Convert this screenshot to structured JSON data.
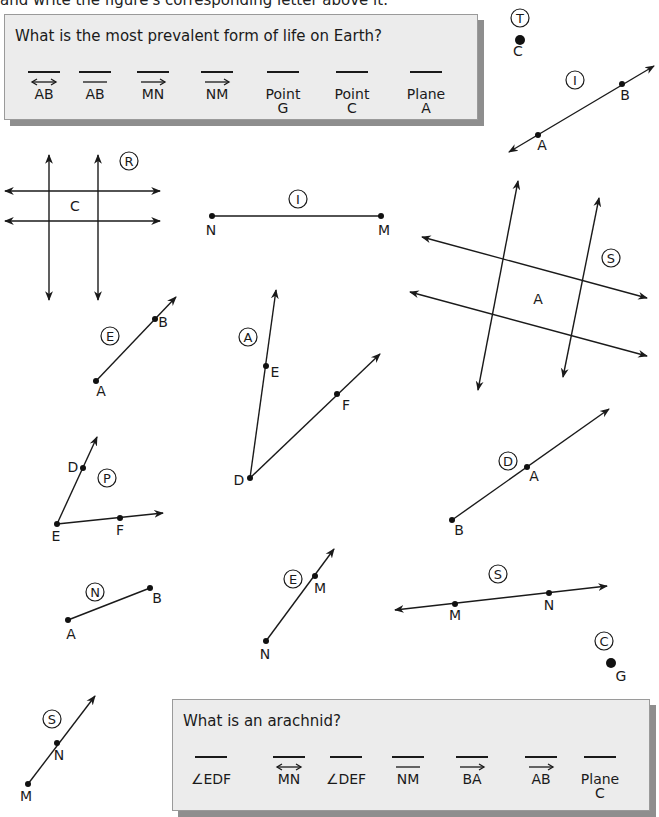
{
  "header": {
    "instruction_fragment": "and write the figure's corresponding letter above it."
  },
  "puzzles": [
    {
      "question": "What is the most prevalent form of life on Earth?",
      "box": {
        "x": 4,
        "y": 14,
        "w": 474,
        "h": 106
      },
      "answers": [
        {
          "label": "AB",
          "notation": "line",
          "cx": 43
        },
        {
          "label": "AB",
          "notation": "segment",
          "cx": 94
        },
        {
          "label": "MN",
          "notation": "ray",
          "cx": 152
        },
        {
          "label": "NM",
          "notation": "ray",
          "cx": 216
        },
        {
          "label": "Point\nG",
          "notation": "none",
          "cx": 282
        },
        {
          "label": "Point\nC",
          "notation": "none",
          "cx": 351
        },
        {
          "label": "Plane\nA",
          "notation": "none",
          "cx": 425
        }
      ]
    },
    {
      "question": "What is an arachnid?",
      "box": {
        "x": 172,
        "y": 699,
        "w": 478,
        "h": 112
      },
      "answers": [
        {
          "label": "∠EDF",
          "notation": "none",
          "cx": 210
        },
        {
          "label": "MN",
          "notation": "line",
          "cx": 288
        },
        {
          "label": "∠DEF",
          "notation": "none",
          "cx": 345
        },
        {
          "label": "NM",
          "notation": "segment",
          "cx": 407
        },
        {
          "label": "BA",
          "notation": "ray",
          "cx": 471
        },
        {
          "label": "AB",
          "notation": "ray",
          "cx": 540
        },
        {
          "label": "Plane\nC",
          "notation": "none",
          "cx": 599
        }
      ]
    }
  ],
  "figures": [
    {
      "id": "point-C",
      "letter": "T",
      "type": "point",
      "letter_pos": [
        520,
        18
      ],
      "points": [
        {
          "name": "C",
          "x": 520,
          "y": 40,
          "lx": 518,
          "ly": 56,
          "big": true
        }
      ]
    },
    {
      "id": "line-AB",
      "letter": "I",
      "type": "line",
      "letter_pos": [
        575,
        80
      ],
      "start": [
        509,
        152
      ],
      "end": [
        654,
        66
      ],
      "points": [
        {
          "name": "A",
          "x": 538,
          "y": 135,
          "lx": 542,
          "ly": 150
        },
        {
          "name": "B",
          "x": 622,
          "y": 84,
          "lx": 625,
          "ly": 100
        }
      ]
    },
    {
      "id": "plane-C",
      "letter": "R",
      "type": "plane",
      "letter_pos": [
        129,
        161
      ],
      "plane_label": {
        "name": "C",
        "x": 75,
        "y": 211
      },
      "lines": [
        [
          [
            5,
            191
          ],
          [
            160,
            191
          ]
        ],
        [
          [
            5,
            221
          ],
          [
            160,
            221
          ]
        ],
        [
          [
            49,
            155
          ],
          [
            49,
            300
          ]
        ],
        [
          [
            98,
            155
          ],
          [
            98,
            300
          ]
        ]
      ],
      "arrows": "both"
    },
    {
      "id": "segment-NM",
      "letter": "I",
      "type": "segment",
      "letter_pos": [
        298,
        199
      ],
      "start": [
        212,
        216
      ],
      "end": [
        381,
        216
      ],
      "points": [
        {
          "name": "N",
          "x": 212,
          "y": 216,
          "lx": 211,
          "ly": 235
        },
        {
          "name": "M",
          "x": 381,
          "y": 216,
          "lx": 384,
          "ly": 235
        }
      ]
    },
    {
      "id": "plane-A",
      "letter": "S",
      "type": "plane",
      "letter_pos": [
        611,
        258
      ],
      "plane_label": {
        "name": "A",
        "x": 538,
        "y": 304
      },
      "lines": [
        [
          [
            422,
            237
          ],
          [
            647,
            298
          ]
        ],
        [
          [
            410,
            292
          ],
          [
            647,
            356
          ]
        ],
        [
          [
            518,
            181
          ],
          [
            478,
            390
          ]
        ],
        [
          [
            599,
            198
          ],
          [
            563,
            377
          ]
        ]
      ],
      "arrows": "mixed"
    },
    {
      "id": "ray-AB",
      "letter": "E",
      "type": "ray",
      "letter_pos": [
        110,
        336
      ],
      "start": [
        96,
        381
      ],
      "end": [
        176,
        297
      ],
      "points": [
        {
          "name": "A",
          "x": 96,
          "y": 381,
          "lx": 101,
          "ly": 396
        },
        {
          "name": "B",
          "x": 155,
          "y": 319,
          "lx": 163,
          "ly": 327
        }
      ]
    },
    {
      "id": "angle-EDF",
      "letter": "A",
      "type": "angle",
      "letter_pos": [
        248,
        337
      ],
      "vertex": [
        250,
        478
      ],
      "ends": [
        [
          276,
          290
        ],
        [
          380,
          354
        ]
      ],
      "points": [
        {
          "name": "D",
          "x": 250,
          "y": 478,
          "lx": 239,
          "ly": 485
        },
        {
          "name": "E",
          "x": 266,
          "y": 366,
          "lx": 275,
          "ly": 377
        },
        {
          "name": "F",
          "x": 337,
          "y": 394,
          "lx": 346,
          "ly": 410
        }
      ]
    },
    {
      "id": "angle-DEF",
      "letter": "P",
      "type": "angle",
      "letter_pos": [
        107,
        478
      ],
      "vertex": [
        57,
        524
      ],
      "ends": [
        [
          97,
          437
        ],
        [
          163,
          513
        ]
      ],
      "points": [
        {
          "name": "E",
          "x": 57,
          "y": 524,
          "lx": 56,
          "ly": 541
        },
        {
          "name": "D",
          "x": 83,
          "y": 468,
          "lx": 73,
          "ly": 472
        },
        {
          "name": "F",
          "x": 120,
          "y": 518,
          "lx": 120,
          "ly": 535
        }
      ]
    },
    {
      "id": "ray-BA",
      "letter": "D",
      "type": "ray",
      "letter_pos": [
        508,
        461
      ],
      "start": [
        452,
        520
      ],
      "end": [
        609,
        409
      ],
      "points": [
        {
          "name": "B",
          "x": 452,
          "y": 520,
          "lx": 459,
          "ly": 535
        },
        {
          "name": "A",
          "x": 527,
          "y": 467,
          "lx": 534,
          "ly": 481
        }
      ]
    },
    {
      "id": "segment-AB",
      "letter": "N",
      "type": "segment",
      "letter_pos": [
        95,
        592
      ],
      "start": [
        68,
        620
      ],
      "end": [
        150,
        588
      ],
      "points": [
        {
          "name": "A",
          "x": 68,
          "y": 620,
          "lx": 71,
          "ly": 639
        },
        {
          "name": "B",
          "x": 150,
          "y": 588,
          "lx": 157,
          "ly": 603
        }
      ]
    },
    {
      "id": "ray-NM",
      "letter": "E",
      "type": "ray",
      "letter_pos": [
        293,
        579
      ],
      "start": [
        266,
        641
      ],
      "end": [
        334,
        549
      ],
      "points": [
        {
          "name": "N",
          "x": 266,
          "y": 641,
          "lx": 265,
          "ly": 659
        },
        {
          "name": "M",
          "x": 315,
          "y": 576,
          "lx": 320,
          "ly": 593
        }
      ]
    },
    {
      "id": "line-MN",
      "letter": "S",
      "type": "line",
      "letter_pos": [
        498,
        574
      ],
      "start": [
        395,
        610
      ],
      "end": [
        607,
        586
      ],
      "points": [
        {
          "name": "M",
          "x": 455,
          "y": 604,
          "lx": 455,
          "ly": 620
        },
        {
          "name": "N",
          "x": 549,
          "y": 593,
          "lx": 549,
          "ly": 610
        }
      ]
    },
    {
      "id": "point-G",
      "letter": "C",
      "type": "point",
      "letter_pos": [
        604,
        641
      ],
      "points": [
        {
          "name": "G",
          "x": 611,
          "y": 663,
          "lx": 621,
          "ly": 681,
          "big": true
        }
      ]
    },
    {
      "id": "ray-MN",
      "letter": "S",
      "type": "ray",
      "letter_pos": [
        52,
        719
      ],
      "start": [
        28,
        784
      ],
      "end": [
        95,
        696
      ],
      "points": [
        {
          "name": "M",
          "x": 28,
          "y": 784,
          "lx": 26,
          "ly": 801
        },
        {
          "name": "N",
          "x": 57,
          "y": 743,
          "lx": 59,
          "ly": 760
        }
      ]
    }
  ]
}
